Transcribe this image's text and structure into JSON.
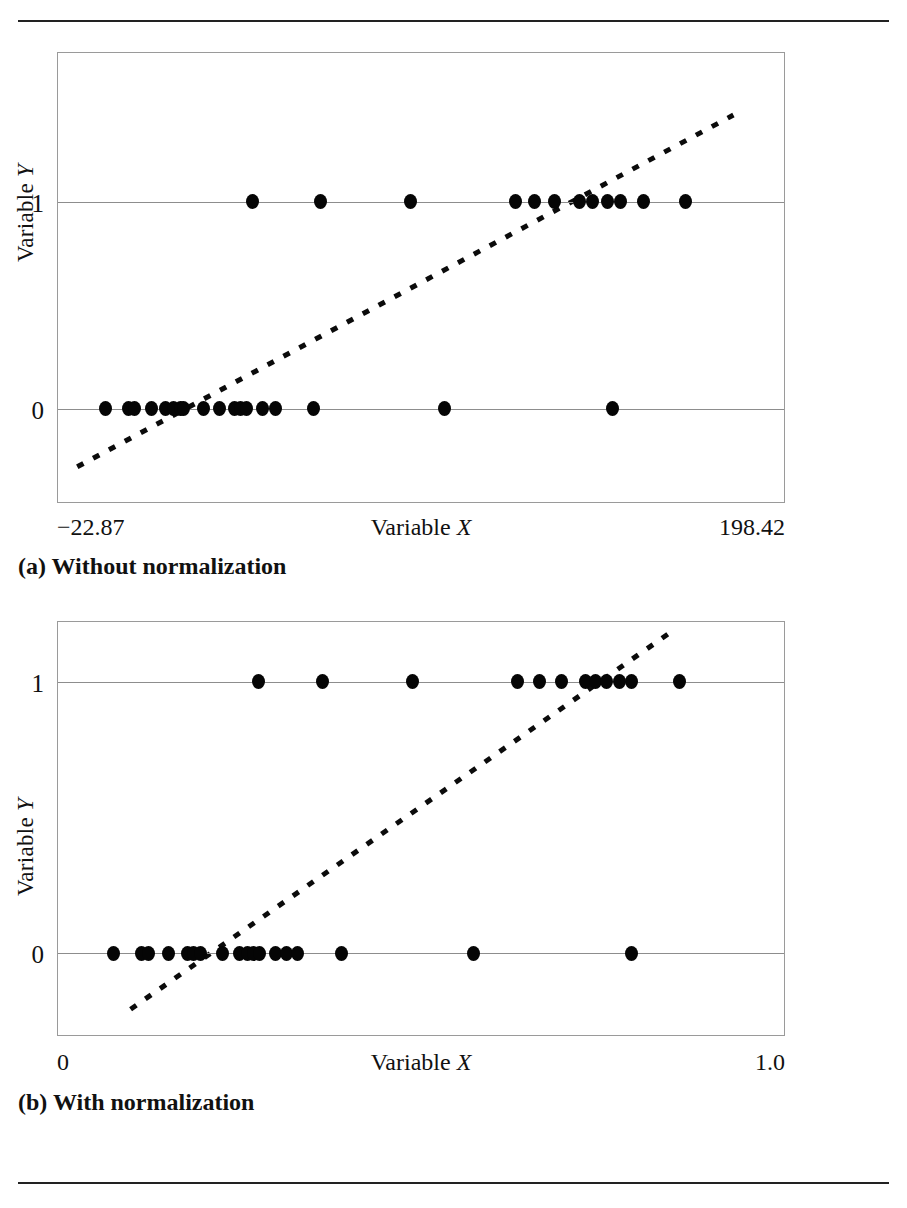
{
  "page": {
    "rules": [
      "top-rule",
      "bottom-rule"
    ]
  },
  "chart_data": [
    {
      "id": "a",
      "type": "scatter",
      "title": "",
      "caption": "(a) Without normalization",
      "xlabel": "Variable X",
      "ylabel": "Variable Y",
      "xlim": [
        -22.87,
        198.42
      ],
      "ylim": [
        -0.45,
        1.72
      ],
      "xticklabels": [
        "−22.87",
        "198.42"
      ],
      "yticklabels": [
        "0",
        "1"
      ],
      "yticks": [
        0,
        1
      ],
      "grid": true,
      "legend": "none",
      "series": [
        {
          "name": "observations y=0",
          "x": [
            -8.5,
            -1.5,
            0.3,
            5.5,
            10.0,
            12.2,
            14.5,
            15.5,
            21.5,
            26.5,
            31.0,
            32.8,
            34.6,
            39.5,
            43.5,
            55.0,
            95.0,
            146.0
          ],
          "y": [
            0,
            0,
            0,
            0,
            0,
            0,
            0,
            0,
            0,
            0,
            0,
            0,
            0,
            0,
            0,
            0,
            0,
            0
          ]
        },
        {
          "name": "observations y=1",
          "x": [
            36.5,
            57.0,
            84.5,
            116.5,
            122.5,
            128.5,
            136.0,
            140.0,
            144.5,
            148.5,
            155.5,
            168.5
          ],
          "y": [
            1,
            1,
            1,
            1,
            1,
            1,
            1,
            1,
            1,
            1,
            1,
            1
          ]
        }
      ],
      "trendline": {
        "style": "dotted",
        "name": "logistic fit",
        "x0": -17.0,
        "y0": -0.28,
        "x1": 183.0,
        "y1": 1.42
      }
    },
    {
      "id": "b",
      "type": "scatter",
      "title": "",
      "caption": "(b) With normalization",
      "xlabel": "Variable X",
      "ylabel": "Variable Y",
      "xlim": [
        0.0,
        1.0
      ],
      "ylim": [
        -0.3,
        1.22
      ],
      "xticklabels": [
        "0",
        "1.0"
      ],
      "yticklabels": [
        "0",
        "1"
      ],
      "yticks": [
        0,
        1
      ],
      "grid": true,
      "legend": "none",
      "series": [
        {
          "name": "observations y=0",
          "x": [
            0.077,
            0.115,
            0.124,
            0.152,
            0.178,
            0.187,
            0.196,
            0.226,
            0.25,
            0.261,
            0.269,
            0.277,
            0.3,
            0.315,
            0.33,
            0.39,
            0.572,
            0.79
          ],
          "y": [
            0,
            0,
            0,
            0,
            0,
            0,
            0,
            0,
            0,
            0,
            0,
            0,
            0,
            0,
            0,
            0,
            0,
            0
          ]
        },
        {
          "name": "observations y=1",
          "x": [
            0.276,
            0.364,
            0.488,
            0.633,
            0.663,
            0.694,
            0.727,
            0.741,
            0.755,
            0.774,
            0.79,
            0.856
          ],
          "y": [
            1,
            1,
            1,
            1,
            1,
            1,
            1,
            1,
            1,
            1,
            1,
            1
          ]
        }
      ],
      "trendline": {
        "style": "dotted",
        "name": "logistic fit",
        "x0": 0.1,
        "y0": -0.205,
        "x1": 0.84,
        "y1": 1.175
      }
    }
  ]
}
